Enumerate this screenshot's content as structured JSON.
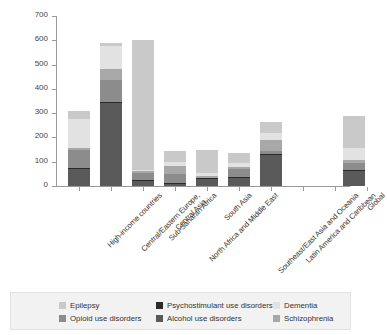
{
  "chart_data": {
    "type": "bar",
    "subtype": "stacked",
    "title": "",
    "xlabel": "",
    "ylabel": "Age-standardized YLL rate (per 100,000)",
    "ylim": [
      0,
      700
    ],
    "yticks": [
      0,
      100,
      200,
      300,
      400,
      500,
      600,
      700
    ],
    "grid": false,
    "legend_position": "bottom",
    "categories": [
      "High-income countries",
      "Central/Eastern Europe, Central Asia",
      "Sub-Saharan Africa",
      "North Africa and Middle East",
      "South Asia",
      "Southeast/East Asia and Oceania",
      "Latin America and Caribbean",
      "Global"
    ],
    "category_lines": [
      [
        "High-income countries"
      ],
      [
        "Central/Eastern Europe,",
        "Central Asia"
      ],
      [
        "Sub-Saharan Africa"
      ],
      [
        "North Africa and Middle East"
      ],
      [
        "South Asia"
      ],
      [
        "Southeast/East Asia and Oceania"
      ],
      [
        "Latin America and Caribbean"
      ],
      [
        "Global"
      ]
    ],
    "series": [
      {
        "name": "Alcohol use disorders",
        "color": "#5a5a5a",
        "values": [
          70,
          340,
          20,
          10,
          30,
          33,
          128,
          65
        ]
      },
      {
        "name": "Psychostimulant use disorders",
        "color": "#2b2b2b",
        "values": [
          4,
          4,
          3,
          2,
          2,
          3,
          4,
          3
        ]
      },
      {
        "name": "Opioid use disorders",
        "color": "#8c8c8c",
        "values": [
          76,
          91,
          29,
          38,
          0,
          36,
          11,
          25
        ]
      },
      {
        "name": "Schizophrenia",
        "color": "#a8a8a8",
        "values": [
          8,
          45,
          8,
          32,
          8,
          8,
          47,
          13
        ]
      },
      {
        "name": "Dementia",
        "color": "#e2e2e2",
        "values": [
          118,
          98,
          6,
          18,
          12,
          16,
          28,
          52
        ]
      },
      {
        "name": "Epilepsy",
        "color": "#c9c9c9",
        "values": [
          32,
          12,
          535,
          45,
          95,
          40,
          46,
          129
        ]
      }
    ],
    "stack_order": [
      "Alcohol use disorders",
      "Psychostimulant use disorders",
      "Opioid use disorders",
      "Schizophrenia",
      "Dementia",
      "Epilepsy"
    ],
    "totals": [
      308,
      590,
      601,
      145,
      147,
      136,
      264,
      287
    ],
    "legend": [
      {
        "label": "Epilepsy",
        "color": "#c9c9c9"
      },
      {
        "label": "Psychostimulant use disorders",
        "color": "#2b2b2b"
      },
      {
        "label": "Dementia",
        "color": "#e2e2e2"
      },
      {
        "label": "Opioid use disorders",
        "color": "#8c8c8c"
      },
      {
        "label": "Alcohol use disorders",
        "color": "#5a5a5a"
      },
      {
        "label": "Schizophrenia",
        "color": "#a8a8a8"
      }
    ]
  }
}
